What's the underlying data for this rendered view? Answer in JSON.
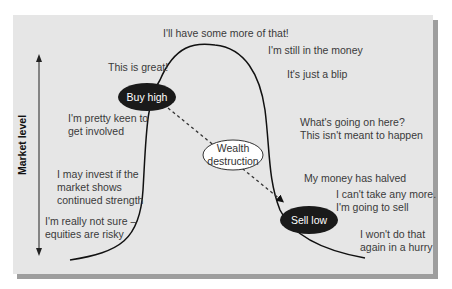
{
  "diagram": {
    "axis_label": "Market level",
    "nodes": {
      "buy_high": "Buy high",
      "sell_low": "Sell low",
      "wealth_destruction_line1": "Wealth",
      "wealth_destruction_line2": "destruction"
    },
    "rising_phase": [
      "I'm really not sure –",
      "equities are risky",
      "I may invest if the",
      "market shows",
      "continued strength",
      "I'm pretty keen to",
      "get involved",
      "This is great!"
    ],
    "peak": "I'll have some more of that!",
    "falling_phase": [
      "I'm still in the money",
      "It's just a blip",
      "What's going on here?",
      "This isn't meant to happen",
      "My money has halved",
      "I can't take any more.",
      "I'm going to sell",
      "I won't do that",
      "again in a hurry"
    ],
    "colors": {
      "panel": "#e6e6e6",
      "shadow": "#9e9e9e",
      "oval": "#1a1a1a",
      "curve": "#111111",
      "text": "#3a3a3a"
    }
  }
}
